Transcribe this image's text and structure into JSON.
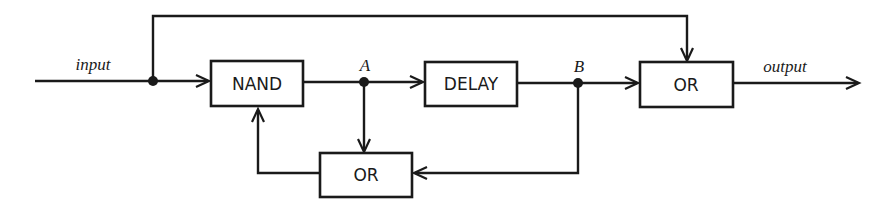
{
  "diagram": {
    "type": "logic block diagram",
    "blocks": [
      {
        "id": "nand",
        "label": "NAND"
      },
      {
        "id": "delay",
        "label": "DELAY"
      },
      {
        "id": "or_out",
        "label": "OR"
      },
      {
        "id": "or_feedback",
        "label": "OR"
      }
    ],
    "signals": {
      "input": "input",
      "output": "output",
      "a": "A",
      "b": "B"
    },
    "connections": [
      {
        "from": "input",
        "to": "nand"
      },
      {
        "from": "input",
        "to": "or_out",
        "via": "top bypass"
      },
      {
        "from": "nand",
        "to": "A"
      },
      {
        "from": "A",
        "to": "delay"
      },
      {
        "from": "A",
        "to": "or_feedback"
      },
      {
        "from": "delay",
        "to": "B"
      },
      {
        "from": "B",
        "to": "or_out"
      },
      {
        "from": "B",
        "to": "or_feedback"
      },
      {
        "from": "or_feedback",
        "to": "nand"
      },
      {
        "from": "or_out",
        "to": "output"
      }
    ],
    "colors": {
      "ink": "#1a1a1a",
      "background": "#ffffff"
    }
  }
}
